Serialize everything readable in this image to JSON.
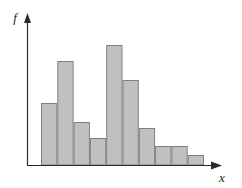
{
  "figure": {
    "title": "",
    "background_color": "#ffffff",
    "width": 242,
    "height": 188
  },
  "axes": {
    "y_axis_label": "f",
    "x_axis_label": "x",
    "axis_color": "#2b2b2b",
    "origin_x": 27,
    "origin_y": 165,
    "y_axis_top": 15,
    "x_axis_right": 222,
    "arrowheads": true,
    "ticks": false,
    "tick_labels": false,
    "grid": false
  },
  "chart_data": {
    "type": "bar",
    "title": "",
    "xlabel": "x",
    "ylabel": "f",
    "categories": [
      "1",
      "2",
      "3",
      "4",
      "5",
      "6",
      "7",
      "8",
      "9",
      "10"
    ],
    "values": [
      62,
      104,
      43,
      27,
      120,
      85,
      37,
      19,
      19,
      10
    ],
    "ylim": [
      0,
      150
    ],
    "grid": false,
    "legend": null,
    "bar_fill_color": "#c0c0c0",
    "bar_border_color": "#808080",
    "bar_count": 10,
    "bar_width_px": 16.3,
    "bars_left_px": 41,
    "bars_right_px": 204,
    "baseline_px": 165,
    "bar_top_px": [
      103,
      61,
      122,
      138,
      45,
      80,
      128,
      146,
      146,
      155
    ]
  }
}
